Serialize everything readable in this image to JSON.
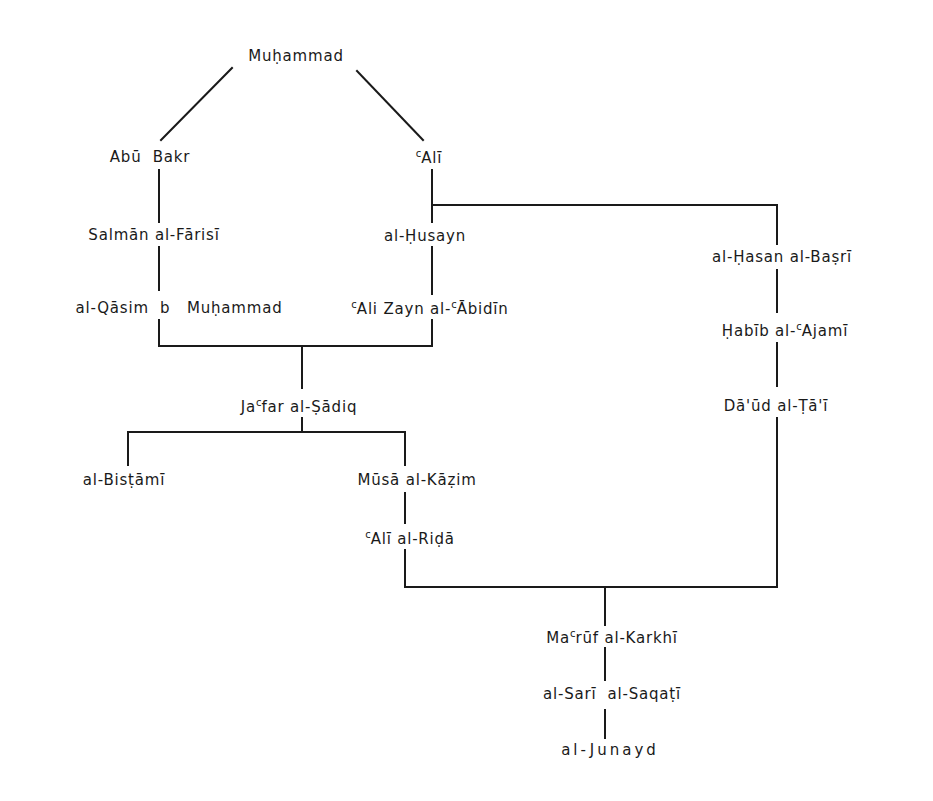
{
  "diagram": {
    "type": "genealogical-chain-of-transmission",
    "line_color": "#1a1a1a",
    "nodes": {
      "muhammad": {
        "label": "Muḥammad"
      },
      "abu_bakr": {
        "label": "Abū  Bakr"
      },
      "ali": {
        "prefix": "c",
        "label": "Alī"
      },
      "salman": {
        "label": "Salmān al-Fārisī"
      },
      "husayn": {
        "label": "al-Ḥusayn"
      },
      "hasan_basri": {
        "label": "al-Ḥasan al-Baṣrī"
      },
      "qasim": {
        "label": "al-Qāsim  b   Muḥammad"
      },
      "zayn": {
        "prefix": "c",
        "label": "Ali Zayn al-",
        "prefix2": "c",
        "label2": "Ābidīn"
      },
      "habib": {
        "label": "Ḥabīb al-",
        "prefix": "c",
        "label2": "Ajamī"
      },
      "jafar": {
        "label": "Ja",
        "prefix": "c",
        "label2": "far al-Ṣādiq"
      },
      "daud": {
        "label": "Dā'ūd al-Ṭā'ī"
      },
      "bistami": {
        "label": "al-Bisṭāmī"
      },
      "musa": {
        "label": "Mūsā al-Kāẓim"
      },
      "rida": {
        "prefix": "c",
        "label": "Alī al-Riḍā"
      },
      "maruf": {
        "label": "Ma",
        "prefix": "c",
        "label2": "rūf al-Karkhī"
      },
      "sari": {
        "label": "al-Sarī  al-Saqaṭī"
      },
      "junayd": {
        "label": "al-Junayd"
      }
    },
    "edges": [
      [
        "Muḥammad",
        "Abū Bakr"
      ],
      [
        "Muḥammad",
        "ʿAlī"
      ],
      [
        "Abū Bakr",
        "Salmān al-Fārisī"
      ],
      [
        "Salmān al-Fārisī",
        "al-Qāsim b Muḥammad"
      ],
      [
        "ʿAlī",
        "al-Ḥusayn"
      ],
      [
        "al-Ḥusayn",
        "ʿAli Zayn al-ʿĀbidīn"
      ],
      [
        "ʿAlī",
        "al-Ḥasan al-Baṣrī"
      ],
      [
        "al-Ḥasan al-Baṣrī",
        "Ḥabīb al-ʿAjamī"
      ],
      [
        "Ḥabīb al-ʿAjamī",
        "Dā'ūd al-Ṭā'ī"
      ],
      [
        "al-Qāsim b Muḥammad",
        "Jaʿfar al-Ṣādiq"
      ],
      [
        "ʿAli Zayn al-ʿĀbidīn",
        "Jaʿfar al-Ṣādiq"
      ],
      [
        "Jaʿfar al-Ṣādiq",
        "al-Bisṭāmī"
      ],
      [
        "Jaʿfar al-Ṣādiq",
        "Mūsā al-Kāẓim"
      ],
      [
        "Mūsā al-Kāẓim",
        "ʿAlī al-Riḍā"
      ],
      [
        "ʿAlī al-Riḍā",
        "Maʿrūf al-Karkhī"
      ],
      [
        "Dā'ūd al-Ṭā'ī",
        "Maʿrūf al-Karkhī"
      ],
      [
        "Maʿrūf al-Karkhī",
        "al-Sarī al-Saqaṭī"
      ],
      [
        "al-Sarī al-Saqaṭī",
        "al-Junayd"
      ]
    ]
  }
}
